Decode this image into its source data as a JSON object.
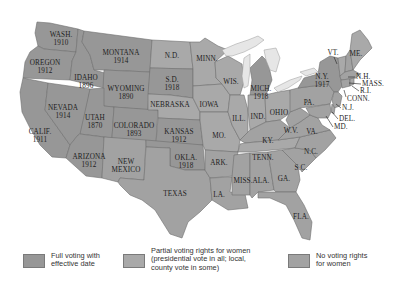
{
  "map": {
    "colors": {
      "full": "#979797",
      "partial": "#a9a9a9",
      "none": "#a2a2a2",
      "lake": "#e6e6e6",
      "border": "#6e6e6e"
    },
    "states": {
      "wa": {
        "name": "WASH.",
        "year": "1910",
        "status": "full"
      },
      "or": {
        "name": "OREGON",
        "year": "1912",
        "status": "full"
      },
      "ca": {
        "name": "CALIF.",
        "year": "1911",
        "status": "full"
      },
      "id": {
        "name": "IDAHO",
        "year": "1896",
        "status": "full"
      },
      "nv": {
        "name": "NEVADA",
        "year": "1914",
        "status": "full"
      },
      "mt": {
        "name": "MONTANA",
        "year": "1914",
        "status": "full"
      },
      "wy": {
        "name": "WYOMING",
        "year": "1890",
        "status": "full"
      },
      "ut": {
        "name": "UTAH",
        "year": "1870",
        "status": "full"
      },
      "co": {
        "name": "COLORADO",
        "year": "1893",
        "status": "full"
      },
      "az": {
        "name": "ARIZONA",
        "year": "1912",
        "status": "full"
      },
      "nm": {
        "name": "NEW\nMEXICO",
        "year": "",
        "status": "none"
      },
      "nd": {
        "name": "N.D.",
        "year": "",
        "status": "partial"
      },
      "sd": {
        "name": "S.D.",
        "year": "1918",
        "status": "full"
      },
      "ne": {
        "name": "NEBRASKA",
        "year": "",
        "status": "partial"
      },
      "ks": {
        "name": "KANSAS",
        "year": "1912",
        "status": "full"
      },
      "ok": {
        "name": "OKLA.",
        "year": "1918",
        "status": "full"
      },
      "tx": {
        "name": "TEXAS",
        "year": "",
        "status": "none"
      },
      "mn": {
        "name": "MINN.",
        "year": "",
        "status": "partial"
      },
      "ia": {
        "name": "IOWA",
        "year": "",
        "status": "partial"
      },
      "mo": {
        "name": "MO.",
        "year": "",
        "status": "partial"
      },
      "ar": {
        "name": "ARK.",
        "year": "",
        "status": "none"
      },
      "la": {
        "name": "LA.",
        "year": "",
        "status": "none"
      },
      "wi": {
        "name": "WIS.",
        "year": "",
        "status": "partial"
      },
      "il": {
        "name": "ILL.",
        "year": "",
        "status": "partial"
      },
      "mi": {
        "name": "MICH.",
        "year": "1918",
        "status": "full"
      },
      "in": {
        "name": "IND.",
        "year": "",
        "status": "partial"
      },
      "oh": {
        "name": "OHIO",
        "year": "",
        "status": "partial"
      },
      "ky": {
        "name": "KY.",
        "year": "",
        "status": "none"
      },
      "tn": {
        "name": "TENN.",
        "year": "",
        "status": "partial"
      },
      "ms": {
        "name": "MISS.",
        "year": "",
        "status": "none"
      },
      "al": {
        "name": "ALA.",
        "year": "",
        "status": "none"
      },
      "ga": {
        "name": "GA.",
        "year": "",
        "status": "none"
      },
      "fl": {
        "name": "FLA.",
        "year": "",
        "status": "none"
      },
      "sc": {
        "name": "S.C.",
        "year": "",
        "status": "none"
      },
      "nc": {
        "name": "N.C.",
        "year": "",
        "status": "none"
      },
      "va": {
        "name": "VA.",
        "year": "",
        "status": "none"
      },
      "wv": {
        "name": "W.V.",
        "year": "",
        "status": "none"
      },
      "pa": {
        "name": "PA.",
        "year": "",
        "status": "none"
      },
      "ny": {
        "name": "N.Y.",
        "year": "1917",
        "status": "full"
      },
      "vt": {
        "name": "VT.",
        "year": "",
        "status": "partial"
      },
      "me": {
        "name": "ME.",
        "year": "",
        "status": "partial"
      },
      "nh": {
        "name": "N.H.",
        "year": "",
        "status": "none"
      },
      "ma": {
        "name": "MASS.",
        "year": "",
        "status": "none"
      },
      "ri": {
        "name": "R.I.",
        "year": "",
        "status": "partial"
      },
      "ct": {
        "name": "CONN.",
        "year": "",
        "status": "none"
      },
      "nj": {
        "name": "N.J.",
        "year": "",
        "status": "none"
      },
      "de": {
        "name": "DEL.",
        "year": "",
        "status": "none"
      },
      "md": {
        "name": "MD.",
        "year": "",
        "status": "none"
      }
    }
  },
  "legend": {
    "items": [
      {
        "label": "Full voting with\neffective date",
        "color": "#979797"
      },
      {
        "label": "Partial voting rights for women\n(presidential vote in all; local,\ncounty vote in some)",
        "color": "#a9a9a9"
      },
      {
        "label": "No voting rights\nfor women",
        "color": "#a2a2a2"
      }
    ]
  }
}
